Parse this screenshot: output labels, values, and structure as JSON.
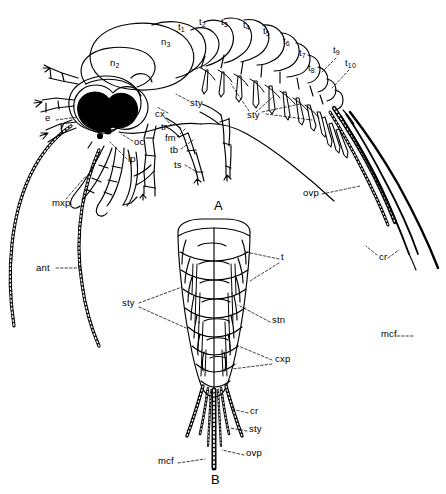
{
  "figure": {
    "background_color": "#ffffff",
    "ink_color": "#000000",
    "panels": [
      {
        "id": "A",
        "label": "A",
        "view": "lateral habitus",
        "x": 216,
        "y": 205
      },
      {
        "id": "B",
        "label": "B",
        "view": "ventral abdomen",
        "x": 214,
        "y": 478
      }
    ]
  },
  "panel_a": {
    "labels": [
      {
        "key": "e",
        "text": "e",
        "x": 45,
        "y": 118,
        "sub": ""
      },
      {
        "key": "n1",
        "text": "n",
        "sub": "1",
        "x": 111,
        "y": 101
      },
      {
        "key": "n2",
        "text": "n",
        "sub": "2",
        "x": 110,
        "y": 63
      },
      {
        "key": "n3",
        "text": "n",
        "sub": "3",
        "x": 161,
        "y": 42
      },
      {
        "key": "oc",
        "text": "oc",
        "x": 124,
        "y": 143,
        "sub": ""
      },
      {
        "key": "lp",
        "text": "lp",
        "x": 118,
        "y": 160,
        "sub": ""
      },
      {
        "key": "mxp",
        "text": "mxp",
        "x": 52,
        "y": 203,
        "sub": ""
      },
      {
        "key": "ant",
        "text": "ant",
        "x": 40,
        "y": 270,
        "sub": ""
      },
      {
        "key": "cx",
        "text": "cx",
        "x": 157,
        "y": 115,
        "sub": ""
      },
      {
        "key": "tr",
        "text": "tr",
        "x": 162,
        "y": 128,
        "sub": ""
      },
      {
        "key": "fm",
        "text": "fm",
        "x": 166,
        "y": 139,
        "sub": ""
      },
      {
        "key": "tb",
        "text": "tb",
        "x": 171,
        "y": 151,
        "sub": ""
      },
      {
        "key": "ts",
        "text": "ts",
        "x": 175,
        "y": 166,
        "sub": ""
      },
      {
        "key": "sty1",
        "text": "sty",
        "x": 190,
        "y": 104,
        "sub": ""
      },
      {
        "key": "sty2",
        "text": "sty",
        "x": 247,
        "y": 116,
        "sub": ""
      },
      {
        "key": "t1",
        "text": "t",
        "sub": "1",
        "x": 178,
        "y": 27
      },
      {
        "key": "t2",
        "text": "t",
        "sub": "2",
        "x": 199,
        "y": 22
      },
      {
        "key": "t3",
        "text": "t",
        "sub": "3",
        "x": 221,
        "y": 22
      },
      {
        "key": "t4",
        "text": "t",
        "sub": "4",
        "x": 243,
        "y": 25
      },
      {
        "key": "t5",
        "text": "t",
        "sub": "5",
        "x": 263,
        "y": 31
      },
      {
        "key": "t6",
        "text": "t",
        "sub": "6",
        "x": 283,
        "y": 41
      },
      {
        "key": "t7",
        "text": "t",
        "sub": "7",
        "x": 299,
        "y": 53
      },
      {
        "key": "t8",
        "text": "t",
        "sub": "8",
        "x": 308,
        "y": 68
      },
      {
        "key": "t9",
        "text": "t",
        "sub": "9",
        "x": 333,
        "y": 50
      },
      {
        "key": "t10",
        "text": "t",
        "sub": "10",
        "x": 345,
        "y": 63
      },
      {
        "key": "ovp",
        "text": "ovp",
        "x": 307,
        "y": 193,
        "sub": ""
      },
      {
        "key": "cr",
        "text": "cr",
        "x": 379,
        "y": 258,
        "sub": ""
      },
      {
        "key": "mcf",
        "text": "mcf",
        "x": 383,
        "y": 334,
        "sub": ""
      }
    ]
  },
  "panel_b": {
    "labels": [
      {
        "key": "t",
        "text": "t",
        "x": 281,
        "y": 257
      },
      {
        "key": "sty1",
        "text": "sty",
        "x": 125,
        "y": 302
      },
      {
        "key": "stn",
        "text": "stn",
        "x": 272,
        "y": 320
      },
      {
        "key": "cxp",
        "text": "cxp",
        "x": 275,
        "y": 359
      },
      {
        "key": "cr",
        "text": "cr",
        "x": 250,
        "y": 411
      },
      {
        "key": "sty2",
        "text": "sty",
        "x": 249,
        "y": 429
      },
      {
        "key": "ovp",
        "text": "ovp",
        "x": 246,
        "y": 453
      },
      {
        "key": "mcf",
        "text": "mcf",
        "x": 161,
        "y": 461
      }
    ]
  },
  "legend_terms": {
    "e": "compound eye",
    "ant": "antenna",
    "oc": "ocellus",
    "lp": "labial palp",
    "mxp": "maxillary palp",
    "n": "notum (thoracic nota n1-n3)",
    "t": "tergite / abdominal segment",
    "stn": "sternite",
    "cx": "coxa",
    "cxp": "coxal plate",
    "tr": "trochanter",
    "fm": "femur",
    "tb": "tibia",
    "ts": "tarsus",
    "sty": "stylus",
    "ovp": "ovipositor",
    "cr": "cercus",
    "mcf": "median caudal filament"
  }
}
